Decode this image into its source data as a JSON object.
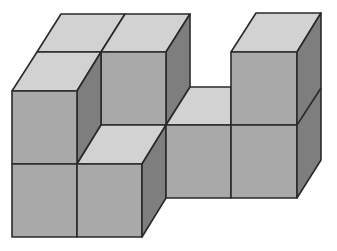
{
  "diagram": {
    "cube_count_visible_front_layer": 7,
    "colors": {
      "top": "#d2d2d2",
      "front": "#a9a9a9",
      "side": "#7e7e7e",
      "edge": "#2a2a2a",
      "background": "#ffffff"
    },
    "faces": [
      {
        "id": "back-left-top",
        "kind": "top",
        "points": "61,14 125,14 101,52 37,52"
      },
      {
        "id": "back-mid-top",
        "kind": "top",
        "points": "125,14 190,14 166,52 101,52"
      },
      {
        "id": "back-mid-side",
        "kind": "side",
        "points": "166,52 190,14 190,87 166,125"
      },
      {
        "id": "back-mid-front",
        "kind": "front",
        "points": "101,52 166,52 166,125 101,125"
      },
      {
        "id": "front-left-top",
        "kind": "top",
        "points": "37,52 101,52 77,91 12,91"
      },
      {
        "id": "front-left-side",
        "kind": "side",
        "points": "77,91 101,52 101,125 77,164"
      },
      {
        "id": "front-left-upper-front",
        "kind": "front",
        "points": "12,91 77,91 77,164 12,164"
      },
      {
        "id": "front-left-lower-front",
        "kind": "front",
        "points": "12,164 77,164 77,237 12,237"
      },
      {
        "id": "front-mid-top",
        "kind": "top",
        "points": "101,125 166,125 142,164 77,164"
      },
      {
        "id": "front-mid-front",
        "kind": "front",
        "points": "77,164 142,164 142,237 77,237"
      },
      {
        "id": "front-mid-side",
        "kind": "side",
        "points": "142,164 166,125 166,198 142,237"
      },
      {
        "id": "right-low-top",
        "kind": "top",
        "points": "190,87 231,87 231,125 166,125"
      },
      {
        "id": "right-low-front-1",
        "kind": "front",
        "points": "166,125 231,125 231,198 166,198"
      },
      {
        "id": "right-tower-top",
        "kind": "top",
        "points": "256,13 321,13 297,52 231,52"
      },
      {
        "id": "right-tower-upper-front",
        "kind": "front",
        "points": "231,52 297,52 297,125 231,125"
      },
      {
        "id": "right-tower-lower-front",
        "kind": "front",
        "points": "231,125 297,125 297,198 231,198"
      },
      {
        "id": "right-tower-side",
        "kind": "side",
        "points": "297,52 321,13 321,160 297,198"
      }
    ],
    "inner_edges": [
      "297,125 321,88"
    ]
  }
}
